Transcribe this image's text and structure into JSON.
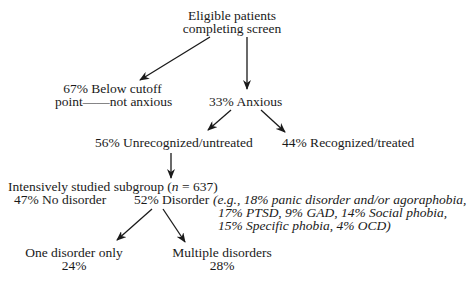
{
  "nodes": {
    "root": {
      "line1": "Eligible patients",
      "line2": "completing screen"
    },
    "below_cutoff": {
      "line1": "67% Below cutoff",
      "line2": "point——not anxious"
    },
    "anxious": {
      "label": "33% Anxious"
    },
    "unrecognized": {
      "label": "56% Unrecognized/untreated"
    },
    "recognized": {
      "label": "44% Recognized/treated"
    },
    "subgroup": {
      "prefix": "Intensively studied subgroup (",
      "n_var": "n",
      "suffix": " = 637)"
    },
    "no_disorder": {
      "label": "47% No disorder"
    },
    "disorder": {
      "label": "52% Disorder"
    },
    "disorder_examples": {
      "line1": "(e.g., 18% panic disorder and/or agoraphobia,",
      "line2": "17% PTSD, 9% GAD, 14% Social phobia,",
      "line3": "15% Specific phobia, 4% OCD)"
    },
    "one_disorder": {
      "line1": "One disorder only",
      "line2": "24%"
    },
    "multiple_disorders": {
      "line1": "Multiple disorders",
      "line2": "28%"
    }
  },
  "edges": [
    {
      "from": "root",
      "to": "below_cutoff"
    },
    {
      "from": "root",
      "to": "anxious"
    },
    {
      "from": "anxious",
      "to": "unrecognized"
    },
    {
      "from": "anxious",
      "to": "recognized"
    },
    {
      "from": "unrecognized",
      "to": "subgroup"
    },
    {
      "from": "disorder",
      "to": "one_disorder"
    },
    {
      "from": "disorder",
      "to": "multiple_disorders"
    }
  ],
  "colors": {
    "ink": "#1a1a1a",
    "background": "#ffffff"
  }
}
